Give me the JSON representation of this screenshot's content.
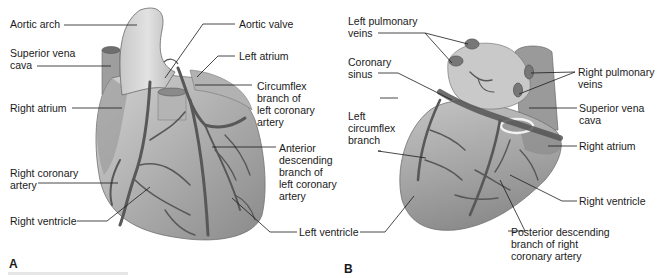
{
  "figure": {
    "panels": [
      {
        "id": "A",
        "letter": "A",
        "view": "anterior",
        "labels": {
          "aortic_arch": "Aortic arch",
          "superior_vena_cava": "Superior vena\ncava",
          "right_atrium": "Right atrium",
          "right_coronary_artery": "Right coronary\nartery",
          "right_ventricle": "Right ventricle",
          "aortic_valve": "Aortic valve",
          "left_atrium": "Left atrium",
          "circumflex_branch": "Circumflex\nbranch of\nleft coronary\nartery",
          "anterior_descending": "Anterior\ndescending\nbranch of\nleft coronary\nartery",
          "left_ventricle": "Left ventricle"
        }
      },
      {
        "id": "B",
        "letter": "B",
        "view": "posterior",
        "labels": {
          "left_pulmonary_veins": "Left pulmonary\nveins",
          "coronary_sinus": "Coronary\nsinus",
          "left_circumflex_branch": "Left\ncircumflex\nbranch",
          "right_pulmonary_veins": "Right pulmonary\nveins",
          "superior_vena_cava": "Superior vena\ncava",
          "right_atrium": "Right atrium",
          "right_ventricle": "Right ventricle",
          "posterior_descending": "Posterior descending\nbranch of right\ncoronary artery"
        }
      }
    ],
    "colors": {
      "heart_fill": "#a9a9a9",
      "heart_light": "#cfcfcf",
      "vessel": "#5a5a5a",
      "leader": "#1a1a1a",
      "background": "#ffffff"
    }
  }
}
